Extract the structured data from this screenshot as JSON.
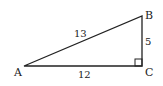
{
  "diagram": {
    "type": "right-triangle",
    "vertices": {
      "A": {
        "label": "A",
        "x": 24,
        "y": 66
      },
      "B": {
        "label": "B",
        "x": 142,
        "y": 16
      },
      "C": {
        "label": "C",
        "x": 142,
        "y": 66
      }
    },
    "sides": {
      "AB": {
        "label": "13"
      },
      "BC": {
        "label": "5"
      },
      "AC": {
        "label": "12"
      }
    },
    "right_angle_at": "C",
    "stroke_color": "#222222"
  }
}
